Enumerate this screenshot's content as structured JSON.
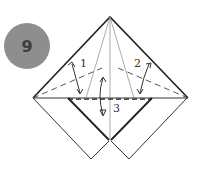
{
  "step": {
    "number": "9",
    "badge_color": "#8e8e8e"
  },
  "fold_labels": [
    "1",
    "2",
    "3"
  ],
  "colors": {
    "line": "#333333",
    "dash": "#444444"
  }
}
